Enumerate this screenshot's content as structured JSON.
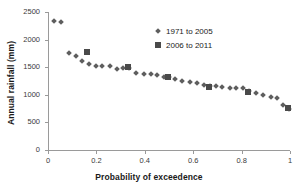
{
  "chart_data": {
    "type": "scatter",
    "title": "",
    "xlabel": "Probability of exceedence",
    "ylabel": "Annual rainfall (mm)",
    "xlim": [
      0,
      1
    ],
    "ylim": [
      0,
      2500
    ],
    "xticks": [
      "0",
      "0.2",
      "0.4",
      "0.6",
      "0.8",
      "1"
    ],
    "xtick_values": [
      0,
      0.2,
      0.4,
      0.6,
      0.8,
      1
    ],
    "yticks": [
      "0",
      "500",
      "1000",
      "1500",
      "2000",
      "2500"
    ],
    "ytick_values": [
      0,
      500,
      1000,
      1500,
      2000,
      2500
    ],
    "grid": false,
    "legend_position": "upper-right-inside",
    "series": [
      {
        "name": "1971 to 2005",
        "marker": "diamond",
        "color": "#5e5e5e",
        "points": [
          [
            0.025,
            2340
          ],
          [
            0.055,
            2320
          ],
          [
            0.085,
            1760
          ],
          [
            0.115,
            1705
          ],
          [
            0.14,
            1620
          ],
          [
            0.17,
            1555
          ],
          [
            0.2,
            1530
          ],
          [
            0.225,
            1525
          ],
          [
            0.255,
            1520
          ],
          [
            0.285,
            1465
          ],
          [
            0.31,
            1480
          ],
          [
            0.335,
            1490
          ],
          [
            0.365,
            1395
          ],
          [
            0.395,
            1385
          ],
          [
            0.425,
            1375
          ],
          [
            0.45,
            1350
          ],
          [
            0.48,
            1325
          ],
          [
            0.5,
            1320
          ],
          [
            0.525,
            1280
          ],
          [
            0.555,
            1255
          ],
          [
            0.585,
            1240
          ],
          [
            0.615,
            1210
          ],
          [
            0.645,
            1185
          ],
          [
            0.67,
            1160
          ],
          [
            0.695,
            1155
          ],
          [
            0.72,
            1150
          ],
          [
            0.75,
            1130
          ],
          [
            0.775,
            1125
          ],
          [
            0.805,
            1125
          ],
          [
            0.83,
            1075
          ],
          [
            0.86,
            1040
          ],
          [
            0.89,
            1000
          ],
          [
            0.92,
            955
          ],
          [
            0.945,
            945
          ],
          [
            0.97,
            820
          ],
          [
            0.995,
            735
          ]
        ]
      },
      {
        "name": "2006 to 2011",
        "marker": "square",
        "color": "#4a4a4a",
        "points": [
          [
            0.16,
            1780
          ],
          [
            0.33,
            1500
          ],
          [
            0.495,
            1325
          ],
          [
            0.665,
            1145
          ],
          [
            0.825,
            1050
          ],
          [
            0.99,
            765
          ]
        ]
      }
    ]
  },
  "legend": {
    "entries": [
      {
        "label": "1971 to 2005",
        "marker": "diamond"
      },
      {
        "label": "2006 to 2011",
        "marker": "square"
      }
    ]
  }
}
